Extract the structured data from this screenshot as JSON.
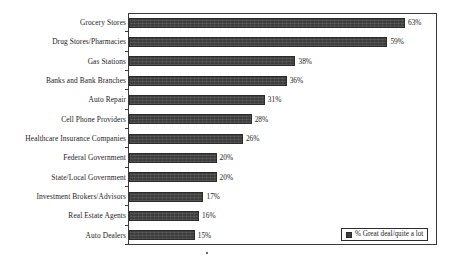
{
  "chart_data": {
    "type": "bar",
    "orientation": "horizontal",
    "title": "",
    "subtitle": "",
    "xlabel": "",
    "ylabel": "",
    "grid": false,
    "xlim": [
      0,
      70
    ],
    "legend_position": "bottom-right",
    "series": [
      {
        "name": "% Great deal/quite a lot",
        "values": [
          63,
          59,
          38,
          36,
          31,
          28,
          26,
          20,
          20,
          17,
          16,
          15
        ]
      }
    ],
    "categories": [
      "Grocery Stores",
      "Drug Stores/Pharmacies",
      "Gas Stations",
      "Banks and Bank Branches",
      "Auto Repair",
      "Cell Phone Providers",
      "Healthcare Insurance Companies",
      "Federal Government",
      "State/Local Government",
      "Investment Brokers/Advisors",
      "Real Estate Agents",
      "Auto Dealers"
    ],
    "data_labels": [
      "63%",
      "59%",
      "38%",
      "36%",
      "31%",
      "28%",
      "26%",
      "20%",
      "20%",
      "17%",
      "16%",
      "15%"
    ],
    "bars": [
      {
        "category": "Grocery Stores",
        "value": 63,
        "label": "63%"
      },
      {
        "category": "Drug Stores/Pharmacies",
        "value": 59,
        "label": "59%"
      },
      {
        "category": "Gas Stations",
        "value": 38,
        "label": "38%"
      },
      {
        "category": "Banks and Bank Branches",
        "value": 36,
        "label": "36%"
      },
      {
        "category": "Auto Repair",
        "value": 31,
        "label": "31%"
      },
      {
        "category": "Cell Phone Providers",
        "value": 28,
        "label": "28%"
      },
      {
        "category": "Healthcare Insurance Companies",
        "value": 26,
        "label": "26%"
      },
      {
        "category": "Federal Government",
        "value": 20,
        "label": "20%"
      },
      {
        "category": "State/Local Government",
        "value": 20,
        "label": "20%"
      },
      {
        "category": "Investment Brokers/Advisors",
        "value": 17,
        "label": "17%"
      },
      {
        "category": "Real Estate Agents",
        "value": 16,
        "label": "16%"
      },
      {
        "category": "Auto Dealers",
        "value": 15,
        "label": "15%"
      }
    ]
  },
  "legend": {
    "entries": [
      {
        "label": "% Great deal/quite a lot",
        "color": "#3d3d3d"
      }
    ]
  },
  "colors": {
    "bar_fill": "#3d3d3d",
    "bar_stroke": "#2b2b2b",
    "frame": "#3a3a3a",
    "text": "#1c1c1c",
    "background": "#ffffff"
  },
  "scale": {
    "px_per_percent": 4.38,
    "plot_left_px": 129
  }
}
